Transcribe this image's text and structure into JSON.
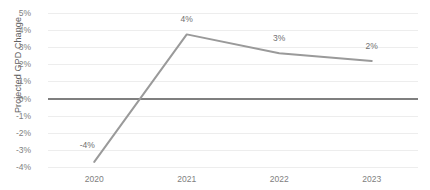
{
  "chart_data": {
    "type": "line",
    "title": "",
    "xlabel": "",
    "ylabel": "Projected GPD Change",
    "categories": [
      "2020",
      "2021",
      "2022",
      "2023"
    ],
    "values": [
      -3.7,
      3.75,
      2.65,
      2.2
    ],
    "point_labels": [
      "-4%",
      "4%",
      "3%",
      "2%"
    ],
    "ylim": [
      -4,
      5
    ],
    "ytick_labels": [
      "5%",
      "4%",
      "3%",
      "2%",
      "1%",
      "0%",
      "-1%",
      "-2%",
      "-3%",
      "-4%"
    ],
    "ytick_values": [
      5,
      4,
      3,
      2,
      1,
      0,
      -1,
      -2,
      -3,
      -4
    ],
    "grid": true,
    "legend": "none",
    "series": [
      {
        "name": "Projected GPD Change",
        "values": [
          -3.7,
          3.75,
          2.65,
          2.2
        ],
        "color": "#9a9a9a"
      }
    ],
    "colors": {
      "line": "#9a9a9a",
      "grid": "#ededed",
      "zero_axis": "#7f7f7f",
      "tick_text": "#808080",
      "label_text": "#707070",
      "background": "#ffffff"
    }
  }
}
